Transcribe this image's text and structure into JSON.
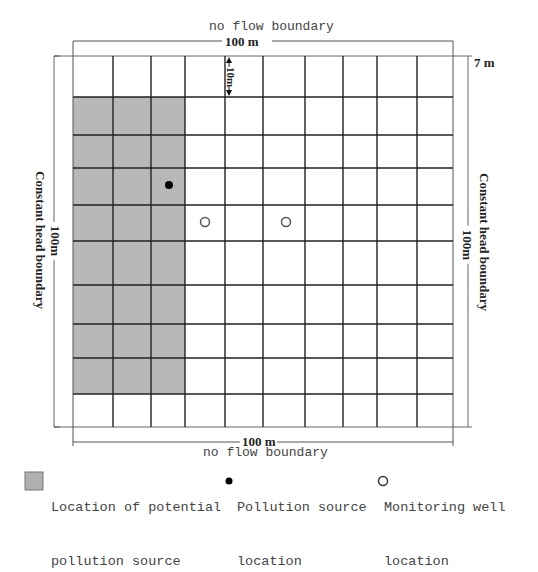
{
  "diagram": {
    "top_boundary_label": "no flow boundary",
    "bottom_boundary_label": "no flow boundary",
    "left_boundary_label": "Constant head boundary",
    "right_boundary_label": "Constant head boundary",
    "top_dimension": "100 m",
    "bottom_dimension": "100 m",
    "left_dimension": "100m",
    "right_dimension": "100m",
    "cell_dimension": "10m",
    "depth_label": "7 m",
    "grid": {
      "columns": 10,
      "rows": 10,
      "cell_size_m": 10
    },
    "shaded_region": {
      "col_start": 0,
      "col_end": 2,
      "row_start": 1,
      "row_end": 8
    },
    "pollution_source": {
      "col": 2,
      "row": 3
    },
    "monitoring_wells": [
      {
        "col": 3,
        "row": 4
      },
      {
        "col": 5,
        "row": 4
      }
    ],
    "colors": {
      "shade": "#b8b8b8",
      "grid_line": "#222222",
      "text": "#444444"
    }
  },
  "legend": {
    "items": [
      {
        "icon": "gray-square",
        "line1": "Location of potential",
        "line2": "pollution source"
      },
      {
        "icon": "filled-dot",
        "line1": "Pollution source",
        "line2": "location"
      },
      {
        "icon": "open-circle",
        "line1": "Monitoring well",
        "line2": "location"
      }
    ]
  }
}
